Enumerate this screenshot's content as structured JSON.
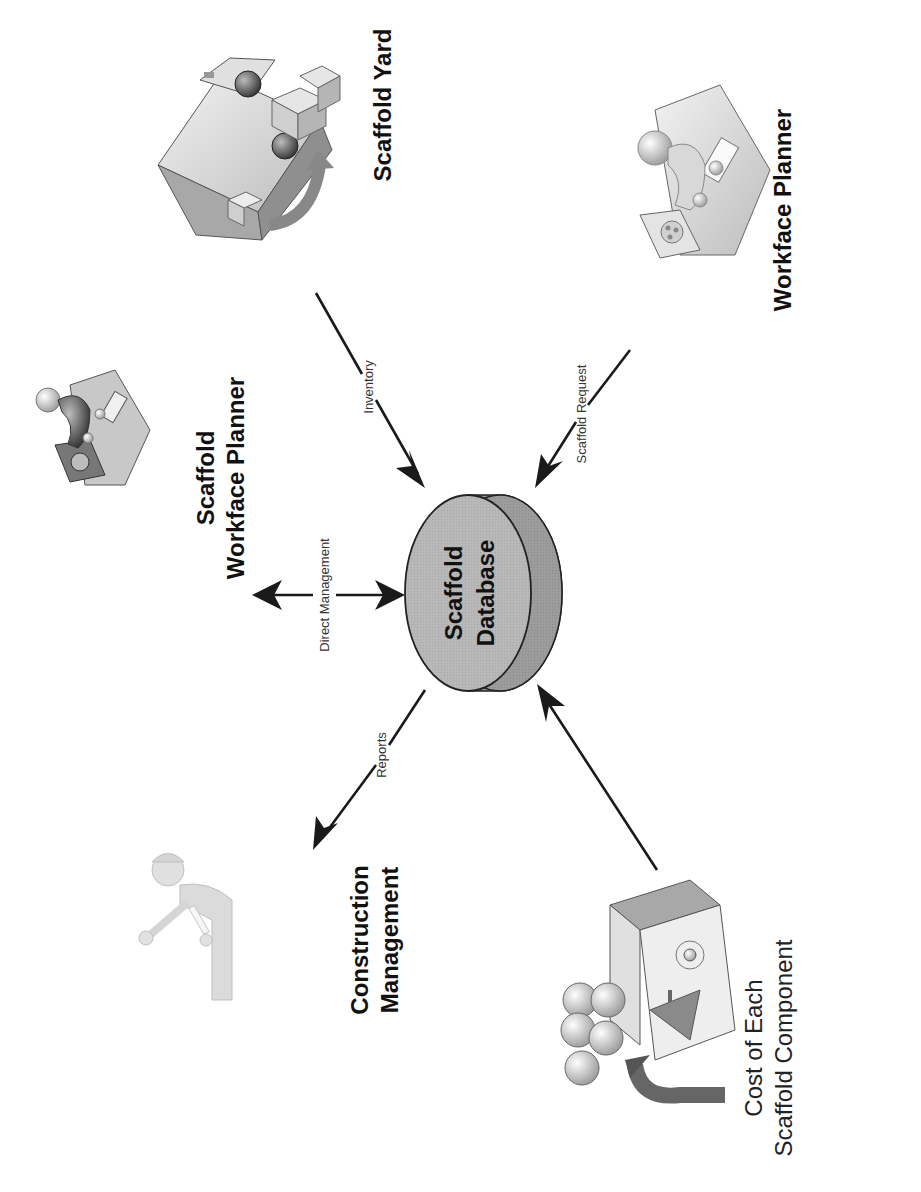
{
  "diagram": {
    "orientation": "rotated-90-ccw",
    "center": {
      "label_line1": "Scaffold",
      "label_line2": "Database",
      "icon": "database-cylinder-icon"
    },
    "nodes": {
      "scaffold_yard": {
        "label": "Scaffold Yard",
        "icon": "truck-boxes-icon"
      },
      "workface_planner": {
        "label": "Workface Planner",
        "icon": "planner-desk-icon"
      },
      "scaffold_workface_planner": {
        "label_line1": "Scaffold",
        "label_line2": "Workface Planner",
        "icon": "planner-desk-icon"
      },
      "construction_management": {
        "label_line1": "Construction",
        "label_line2": "Management",
        "icon": "worker-hardhat-icon"
      },
      "cost_component": {
        "label_line1": "Cost of Each",
        "label_line2": "Scaffold Component",
        "icon": "coins-cashregister-icon"
      }
    },
    "edges": [
      {
        "id": "inventory",
        "label": "Inventory",
        "from": "Scaffold Yard",
        "to": "Scaffold Database",
        "direction": "to-database"
      },
      {
        "id": "scaffold_request",
        "label": "Scaffold Request",
        "from": "Workface Planner",
        "to": "Scaffold Database",
        "direction": "to-database"
      },
      {
        "id": "direct_management",
        "label": "Direct Management",
        "from": "Scaffold Workface Planner",
        "to": "Scaffold Database",
        "direction": "bidirectional"
      },
      {
        "id": "reports",
        "label": "Reports",
        "from": "Scaffold Database",
        "to": "Construction Management",
        "direction": "from-database"
      },
      {
        "id": "cost",
        "label": "",
        "from": "Cost of Each Scaffold Component",
        "to": "Scaffold Database",
        "direction": "to-database"
      }
    ],
    "colors": {
      "db_front": "#b4b4b4",
      "db_side": "#9a9a9a",
      "line": "#1a1a1a",
      "background": "#ffffff"
    }
  }
}
